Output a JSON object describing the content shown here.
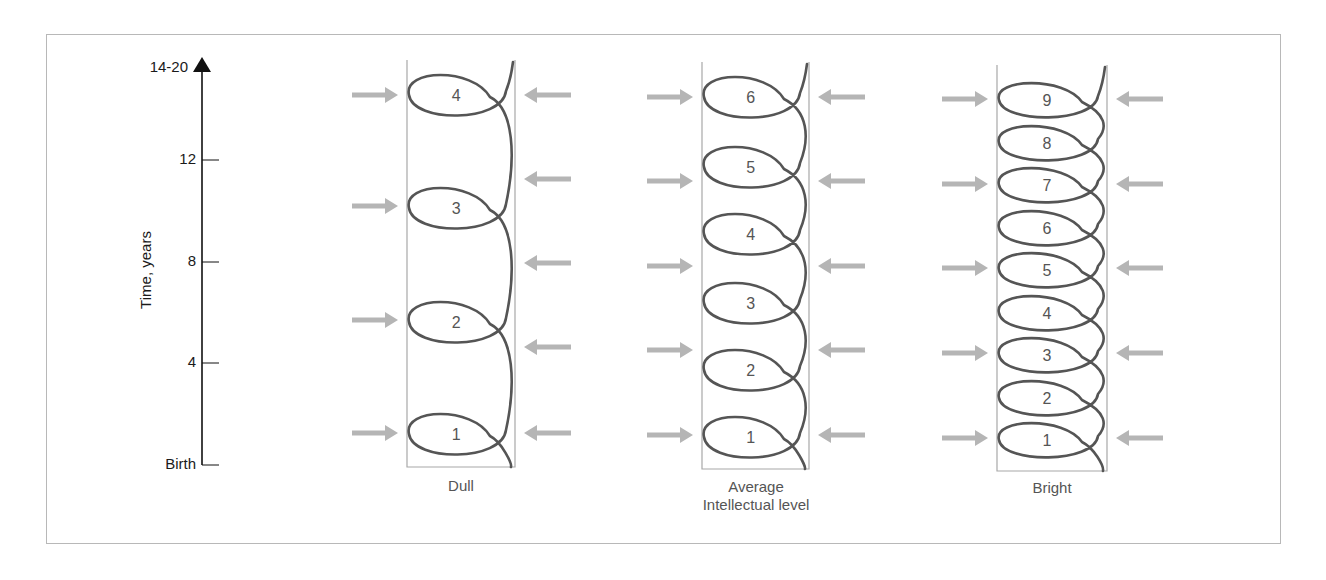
{
  "figure": {
    "axis": {
      "title": "Time, years",
      "ticks": [
        {
          "label": "14-20",
          "y": 68
        },
        {
          "label": "12",
          "y": 160
        },
        {
          "label": "8",
          "y": 262
        },
        {
          "label": "4",
          "y": 363
        },
        {
          "label": "Birth",
          "y": 465
        }
      ]
    },
    "columns": [
      {
        "name": "dull",
        "label": "Dull",
        "label2": "",
        "box": {
          "x1": 407,
          "x2": 515,
          "top": 60,
          "bottom": 467
        },
        "loops": [
          {
            "n": "1",
            "y": 434
          },
          {
            "n": "2",
            "y": 322
          },
          {
            "n": "3",
            "y": 208
          },
          {
            "n": "4",
            "y": 95
          }
        ],
        "left_arrows_y": [
          433,
          320,
          206,
          95
        ],
        "right_arrows_y": [
          433,
          347,
          263,
          179,
          95
        ]
      },
      {
        "name": "average",
        "label": "Average",
        "label2": "Intellectual level",
        "box": {
          "x1": 702,
          "x2": 809,
          "top": 62,
          "bottom": 469
        },
        "loops": [
          {
            "n": "1",
            "y": 437
          },
          {
            "n": "2",
            "y": 370
          },
          {
            "n": "3",
            "y": 303
          },
          {
            "n": "4",
            "y": 234
          },
          {
            "n": "5",
            "y": 167
          },
          {
            "n": "6",
            "y": 97
          }
        ],
        "left_arrows_y": [
          435,
          350,
          266,
          181,
          97
        ],
        "right_arrows_y": [
          435,
          350,
          266,
          181,
          97
        ]
      },
      {
        "name": "bright",
        "label": "Bright",
        "label2": "",
        "box": {
          "x1": 997,
          "x2": 1107,
          "top": 65,
          "bottom": 471
        },
        "loops": [
          {
            "n": "1",
            "y": 440
          },
          {
            "n": "2",
            "y": 398
          },
          {
            "n": "3",
            "y": 355
          },
          {
            "n": "4",
            "y": 313
          },
          {
            "n": "5",
            "y": 270
          },
          {
            "n": "6",
            "y": 228
          },
          {
            "n": "7",
            "y": 185
          },
          {
            "n": "8",
            "y": 143
          },
          {
            "n": "9",
            "y": 100
          }
        ],
        "left_arrows_y": [
          438,
          353,
          268,
          184,
          99
        ],
        "right_arrows_y": [
          438,
          353,
          268,
          184,
          99
        ]
      }
    ],
    "colors": {
      "spiral": "#555555",
      "arrow": "#b5b5b5",
      "box": "#a8a8a8",
      "axis": "#111111"
    }
  }
}
